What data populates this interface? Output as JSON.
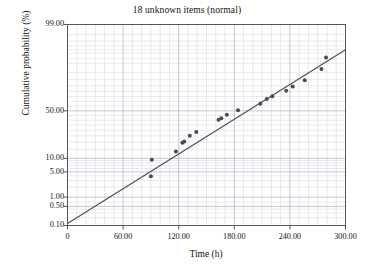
{
  "chart_data": {
    "type": "scatter",
    "title": "18 unknown items (normal)",
    "xlabel": "Time (h)",
    "ylabel": "Cumulative probability (%)",
    "grid": true,
    "legend": "none",
    "y_scale": "normal-probability",
    "x_scale": "linear",
    "xlim": [
      0,
      300
    ],
    "ylim": [
      0.1,
      99.0
    ],
    "x_ticks": [
      0,
      60,
      120,
      180,
      240,
      300
    ],
    "x_tick_labels": [
      "0",
      "60.00",
      "120.00",
      "180.00",
      "240.00",
      "300.00"
    ],
    "x_minor_step": 10,
    "y_ticks": [
      0.1,
      0.5,
      1.0,
      5.0,
      10.0,
      50.0,
      99.0
    ],
    "y_tick_labels": [
      "0.10",
      "0.50",
      "1.00",
      "5.00",
      "10.00",
      "50.00",
      "99.00"
    ],
    "y_minor_ticks": [
      0.2,
      0.3,
      0.7,
      2,
      3,
      20,
      30,
      40,
      60,
      70,
      80,
      90,
      95,
      97
    ],
    "point_count": 18,
    "marker_color": "#4a4a52",
    "line_color": "#4a4a52",
    "grid_color": "#c9c9d2",
    "frame_color": "#55555c",
    "series": [
      {
        "name": "18 unknown items",
        "marker": "filled-circle",
        "points": [
          {
            "x": 90,
            "y": 3.9
          },
          {
            "x": 91,
            "y": 9.4
          },
          {
            "x": 117,
            "y": 13.6
          },
          {
            "x": 124,
            "y": 19.5
          },
          {
            "x": 126,
            "y": 20.4
          },
          {
            "x": 132,
            "y": 25.0
          },
          {
            "x": 139,
            "y": 28.5
          },
          {
            "x": 163,
            "y": 40.5
          },
          {
            "x": 166,
            "y": 42.0
          },
          {
            "x": 172,
            "y": 45.8
          },
          {
            "x": 184,
            "y": 50.5
          },
          {
            "x": 208,
            "y": 57.6
          },
          {
            "x": 215,
            "y": 62.5
          },
          {
            "x": 221,
            "y": 65.2
          },
          {
            "x": 236,
            "y": 70.5
          },
          {
            "x": 243,
            "y": 74.5
          },
          {
            "x": 256,
            "y": 79.5
          },
          {
            "x": 274,
            "y": 87.0
          },
          {
            "x": 279,
            "y": 92.5
          }
        ]
      }
    ],
    "fit_line": {
      "name": "normal fit",
      "start": {
        "x": 0,
        "y": 0.12
      },
      "end": {
        "x": 300,
        "y": 95.0
      }
    }
  }
}
